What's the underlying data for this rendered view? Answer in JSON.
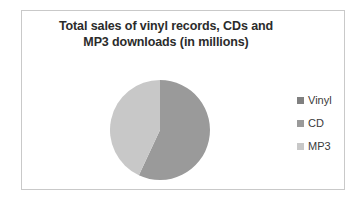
{
  "chart_data": {
    "type": "pie",
    "title": "Total sales of vinyl records, CDs and MP3 downloads (in millions)",
    "title_lines": [
      "Total sales of vinyl records, CDs and",
      "MP3 downloads (in millions)"
    ],
    "categories": [
      "Vinyl",
      "CD",
      "MP3"
    ],
    "values": [
      0,
      57,
      43
    ],
    "units": "millions",
    "legend_position": "right",
    "grid": false,
    "slices": [
      {
        "label": "Vinyl",
        "value": 0,
        "percent": 0,
        "color": "#808080",
        "start_angle": 0,
        "end_angle": 0
      },
      {
        "label": "CD",
        "value": 57,
        "percent": 57,
        "color": "#9a9a9a",
        "start_angle": 0,
        "end_angle": 205
      },
      {
        "label": "MP3",
        "value": 43,
        "percent": 43,
        "color": "#c8c8c8",
        "start_angle": 205,
        "end_angle": 360
      }
    ]
  },
  "legend": {
    "items": [
      {
        "label": "Vinyl",
        "color": "#808080"
      },
      {
        "label": "CD",
        "color": "#9a9a9a"
      },
      {
        "label": "MP3",
        "color": "#c8c8c8"
      }
    ]
  },
  "frame": {
    "border_color": "#c9c9c9",
    "background": "#ffffff"
  }
}
